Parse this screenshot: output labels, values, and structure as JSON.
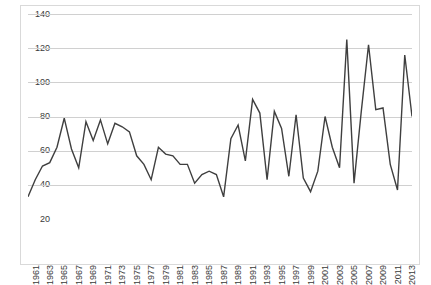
{
  "chart_data": {
    "type": "line",
    "title": "",
    "subtitle": "",
    "xlabel": "",
    "ylabel": "",
    "legend": [],
    "legend_position": "none",
    "grid": true,
    "grid_axis": "y",
    "ylim": [
      20,
      140
    ],
    "ytick_step": 20,
    "yticks": [
      20,
      40,
      60,
      80,
      100,
      120,
      140
    ],
    "ytick_labels": [
      "20",
      "40",
      "60",
      "80",
      "100",
      "120",
      "140"
    ],
    "xlim": [
      1961,
      2014
    ],
    "xtick_step": 2,
    "xticks": [
      1961,
      1963,
      1965,
      1967,
      1969,
      1971,
      1973,
      1975,
      1977,
      1979,
      1981,
      1983,
      1985,
      1987,
      1989,
      1991,
      1993,
      1995,
      1997,
      1999,
      2001,
      2003,
      2005,
      2007,
      2009,
      2011,
      2013
    ],
    "xtick_labels": [
      "1961",
      "1963",
      "1965",
      "1967",
      "1969",
      "1971",
      "1973",
      "1975",
      "1977",
      "1979",
      "1981",
      "1983",
      "1985",
      "1987",
      "1989",
      "1991",
      "1993",
      "1995",
      "1997",
      "1999",
      "2001",
      "2003",
      "2005",
      "2007",
      "2009",
      "2011",
      "2013"
    ],
    "x": [
      1961,
      1962,
      1963,
      1964,
      1965,
      1966,
      1967,
      1968,
      1969,
      1970,
      1971,
      1972,
      1973,
      1974,
      1975,
      1976,
      1977,
      1978,
      1979,
      1980,
      1981,
      1982,
      1983,
      1984,
      1985,
      1986,
      1987,
      1988,
      1989,
      1990,
      1991,
      1992,
      1993,
      1994,
      1995,
      1996,
      1997,
      1998,
      1999,
      2000,
      2001,
      2002,
      2003,
      2004,
      2005,
      2006,
      2007,
      2008,
      2009,
      2010,
      2011,
      2012,
      2013,
      2014
    ],
    "values": [
      33,
      43,
      51,
      53,
      62,
      79,
      61,
      50,
      77,
      66,
      78,
      64,
      76,
      74,
      71,
      57,
      52,
      43,
      62,
      58,
      57,
      52,
      52,
      41,
      46,
      48,
      46,
      33,
      67,
      75,
      54,
      90,
      82,
      43,
      83,
      73,
      45,
      81,
      44,
      36,
      48,
      80,
      62,
      50,
      125,
      41,
      83,
      122,
      84,
      85,
      52,
      37,
      116,
      80
    ],
    "series": [
      {
        "name": "series-1",
        "color": "#3f3f3f",
        "values": [
          33,
          43,
          51,
          53,
          62,
          79,
          61,
          50,
          77,
          66,
          78,
          64,
          76,
          74,
          71,
          57,
          52,
          43,
          62,
          58,
          57,
          52,
          52,
          41,
          46,
          48,
          46,
          33,
          67,
          75,
          54,
          90,
          82,
          43,
          83,
          73,
          45,
          81,
          44,
          36,
          48,
          80,
          62,
          50,
          125,
          41,
          83,
          122,
          84,
          85,
          52,
          37,
          116,
          80
        ]
      }
    ],
    "colors": {
      "line": "#3f3f3f",
      "grid": "#d0d0d0",
      "frame": "#d9d9d9",
      "text": "#3a3a3a",
      "background": "#ffffff"
    }
  }
}
